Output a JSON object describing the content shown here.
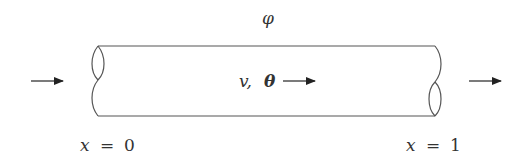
{
  "diagram": {
    "title_symbol": "φ",
    "flow_label_v": "v,",
    "flow_label_theta": "θ",
    "left_position": {
      "var": "x",
      "eq": "=",
      "value": "0"
    },
    "right_position": {
      "var": "x",
      "eq": "=",
      "value": "1"
    },
    "colors": {
      "stroke": "#444444",
      "text": "#333333",
      "background": "#ffffff"
    },
    "elements": [
      "inlet-arrow",
      "pipe-body",
      "inner-flow-arrow",
      "outlet-arrow",
      "left-break-mark",
      "right-break-mark"
    ]
  }
}
